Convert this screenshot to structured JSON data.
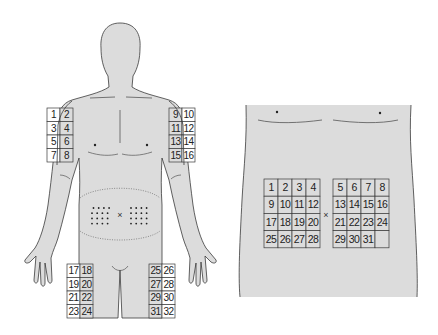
{
  "colors": {
    "skin": "#dcdcdc",
    "outline": "#3a3a3a",
    "cell_white": "#ffffff",
    "cell_shaded": "#dcdcdc",
    "text": "#222222"
  },
  "front_figure": {
    "label": "front-body",
    "left_upper_arm_sites": [
      "1",
      "2",
      "3",
      "4",
      "5",
      "6",
      "7",
      "8"
    ],
    "right_upper_arm_sites": [
      "9",
      "10",
      "11",
      "12",
      "13",
      "14",
      "15",
      "16"
    ],
    "left_thigh_sites": [
      "17",
      "18",
      "19",
      "20",
      "21",
      "22",
      "23",
      "24"
    ],
    "right_thigh_sites": [
      "25",
      "26",
      "27",
      "28",
      "29",
      "30",
      "31",
      "32"
    ],
    "navel_marker": "×",
    "abdomen_dot_rows": 4,
    "abdomen_dot_cols_per_side": 4
  },
  "abdomen_closeup": {
    "left_grid": [
      [
        "1",
        "2",
        "3",
        "4"
      ],
      [
        "9",
        "10",
        "11",
        "12"
      ],
      [
        "17",
        "18",
        "19",
        "20"
      ],
      [
        "25",
        "26",
        "27",
        "28"
      ]
    ],
    "right_grid": [
      [
        "5",
        "6",
        "7",
        "8"
      ],
      [
        "13",
        "14",
        "15",
        "16"
      ],
      [
        "21",
        "22",
        "23",
        "24"
      ],
      [
        "29",
        "30",
        "31",
        ""
      ]
    ],
    "navel_marker": "×"
  }
}
